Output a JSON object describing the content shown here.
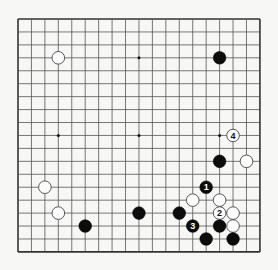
{
  "board": {
    "size": 19,
    "origin": {
      "x": 18,
      "y": 19
    },
    "spacing": {
      "x": 13.44,
      "y": 12.94
    },
    "line_color": "#555555",
    "edge_color": "#333333",
    "background": "#f7f7f5",
    "star_points": [
      [
        3,
        3
      ],
      [
        9,
        3
      ],
      [
        15,
        3
      ],
      [
        3,
        9
      ],
      [
        9,
        9
      ],
      [
        15,
        9
      ],
      [
        3,
        15
      ],
      [
        9,
        15
      ],
      [
        15,
        15
      ]
    ]
  },
  "stones": [
    {
      "color": "white",
      "col": 3,
      "row": 3,
      "label": ""
    },
    {
      "color": "black",
      "col": 15,
      "row": 3,
      "label": ""
    },
    {
      "color": "white",
      "col": 16,
      "row": 9,
      "label": "4"
    },
    {
      "color": "black",
      "col": 15,
      "row": 11,
      "label": ""
    },
    {
      "color": "white",
      "col": 17,
      "row": 11,
      "label": ""
    },
    {
      "color": "black",
      "col": 14,
      "row": 13,
      "label": "1"
    },
    {
      "color": "white",
      "col": 2,
      "row": 13,
      "label": ""
    },
    {
      "color": "white",
      "col": 13,
      "row": 14,
      "label": ""
    },
    {
      "color": "white",
      "col": 15,
      "row": 14,
      "label": ""
    },
    {
      "color": "white",
      "col": 3,
      "row": 15,
      "label": ""
    },
    {
      "color": "black",
      "col": 9,
      "row": 15,
      "label": ""
    },
    {
      "color": "black",
      "col": 12,
      "row": 15,
      "label": ""
    },
    {
      "color": "white",
      "col": 15,
      "row": 15,
      "label": "2"
    },
    {
      "color": "white",
      "col": 16,
      "row": 15,
      "label": ""
    },
    {
      "color": "black",
      "col": 5,
      "row": 16,
      "label": ""
    },
    {
      "color": "black",
      "col": 13,
      "row": 16,
      "label": "3"
    },
    {
      "color": "black",
      "col": 15,
      "row": 16,
      "label": ""
    },
    {
      "color": "white",
      "col": 16,
      "row": 16,
      "label": ""
    },
    {
      "color": "black",
      "col": 14,
      "row": 17,
      "label": ""
    },
    {
      "color": "black",
      "col": 16,
      "row": 17,
      "label": ""
    }
  ]
}
